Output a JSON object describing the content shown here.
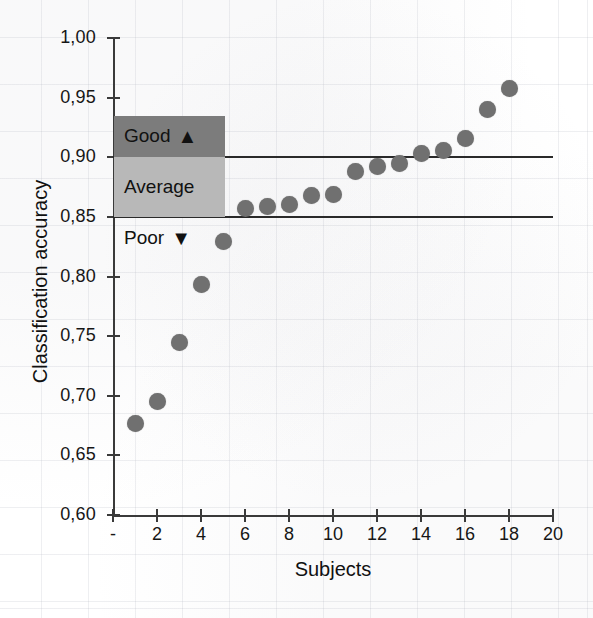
{
  "chart_data": {
    "type": "scatter",
    "title": "",
    "xlabel": "Subjects",
    "ylabel": "Classification accuracy",
    "xlim": [
      0,
      20
    ],
    "ylim": [
      0.6,
      1.0
    ],
    "grid": "faint-paper-grid",
    "legend_position": "none",
    "x": [
      1,
      2,
      3,
      4,
      5,
      6,
      7,
      8,
      9,
      10,
      11,
      12,
      13,
      14,
      15,
      16,
      17,
      18
    ],
    "values": [
      0.677,
      0.695,
      0.745,
      0.793,
      0.829,
      0.857,
      0.859,
      0.86,
      0.868,
      0.869,
      0.888,
      0.892,
      0.895,
      0.903,
      0.906,
      0.916,
      0.94,
      0.958
    ],
    "series": [
      {
        "name": "Classification accuracy per subject",
        "marker": "circle",
        "color": "#707070",
        "values": [
          0.677,
          0.695,
          0.745,
          0.793,
          0.829,
          0.857,
          0.859,
          0.86,
          0.868,
          0.869,
          0.888,
          0.892,
          0.895,
          0.903,
          0.906,
          0.916,
          0.94,
          0.958
        ]
      }
    ],
    "x_tick_labels": [
      "-",
      "2",
      "4",
      "6",
      "8",
      "10",
      "12",
      "14",
      "16",
      "18",
      "20"
    ],
    "x_tick_values": [
      0,
      2,
      4,
      6,
      8,
      10,
      12,
      14,
      16,
      18,
      20
    ],
    "y_tick_labels": [
      "1,00",
      "0,95",
      "0,90",
      "0,85",
      "0,80",
      "0,75",
      "0,70",
      "0,65",
      "0,60"
    ],
    "y_tick_values": [
      1.0,
      0.95,
      0.9,
      0.85,
      0.8,
      0.75,
      0.7,
      0.65,
      0.6
    ],
    "threshold_lines": [
      {
        "label": "good-threshold",
        "value": 0.9
      },
      {
        "label": "average-threshold",
        "value": 0.85
      }
    ],
    "annotations": [
      {
        "name": "good",
        "label": "Good",
        "glyph": "▲",
        "glyph_name": "triangle-up",
        "y_from": 0.9,
        "y_to": 0.935,
        "color": "#7c7c7c"
      },
      {
        "name": "average",
        "label": "Average",
        "glyph": "",
        "glyph_name": "",
        "y_from": 0.85,
        "y_to": 0.9,
        "color": "#b8b8b8"
      },
      {
        "name": "poor",
        "label": "Poor",
        "glyph": "▼",
        "glyph_name": "triangle-down",
        "y_from": 0.815,
        "y_to": 0.85,
        "color": "transparent"
      }
    ]
  },
  "colors": {
    "marker": "#707070",
    "axis": "#3a3a3a",
    "threshold": "#2a2a2a",
    "band_good": "#7c7c7c",
    "band_average": "#b8b8b8",
    "text": "#111111",
    "background": "#ffffff"
  }
}
